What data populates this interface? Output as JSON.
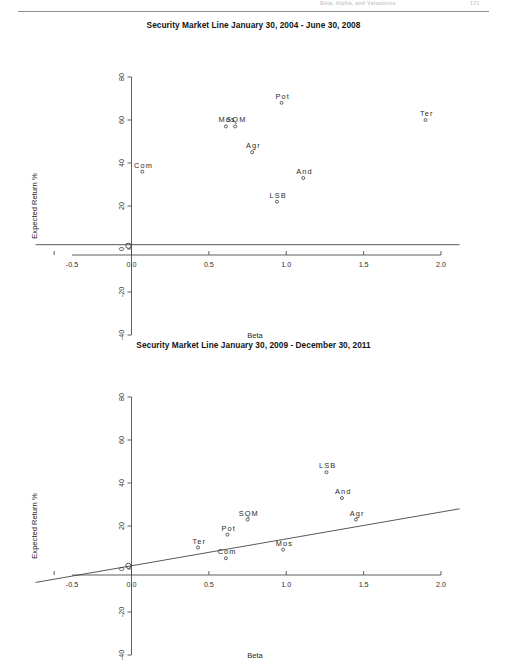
{
  "page": {
    "header_ghost_center": "Beta, Alpha, and Valuations",
    "header_ghost_right": "171"
  },
  "figures": [
    {
      "id": "figure-1",
      "title": "Security Market Line January 30, 2004 - June 30, 2008",
      "axis": {
        "xlabel": "Beta",
        "ylabel": "Expected Return %",
        "xticks": [
          "-0.5",
          "0.0",
          "0.5",
          "1.0",
          "1.5",
          "2.0"
        ],
        "xtick_values": [
          -0.5,
          0.0,
          0.5,
          1.0,
          1.5,
          2.0
        ],
        "yticks": [
          "80",
          "60",
          "40",
          "20",
          "0",
          "-20",
          "-40"
        ],
        "ytick_values": [
          80,
          60,
          40,
          20,
          0,
          -20,
          -40
        ]
      }
    },
    {
      "id": "figure-2",
      "title": "Security Market Line January 30, 2009 - December 30, 2011",
      "axis": {
        "xlabel": "Beta",
        "ylabel": "Expected Return %",
        "xticks": [
          "-0.5",
          "0.0",
          "0.5",
          "1.0",
          "1.5",
          "2.0"
        ],
        "xtick_values": [
          -0.5,
          0.0,
          0.5,
          1.0,
          1.5,
          2.0
        ],
        "yticks": [
          "80",
          "60",
          "40",
          "20",
          "0",
          "-20",
          "-40"
        ],
        "ytick_values": [
          80,
          60,
          40,
          20,
          0,
          -20,
          -40
        ]
      }
    }
  ],
  "chart_data": [
    {
      "type": "scatter",
      "title": "Security Market Line January 30, 2004 - June 30, 2008",
      "xlabel": "Beta",
      "ylabel": "Expected Return %",
      "xlim": [
        -0.62,
        2.12
      ],
      "ylim": [
        -44,
        84
      ],
      "grid": false,
      "legend": "none",
      "axis_style": "centered-cross",
      "points": [
        {
          "label": "Com",
          "x": 0.07,
          "y": 36
        },
        {
          "label": "Mos",
          "x": 0.61,
          "y": 57
        },
        {
          "label": "SQM",
          "x": 0.67,
          "y": 57
        },
        {
          "label": "Agr",
          "x": 0.78,
          "y": 45
        },
        {
          "label": "Pot",
          "x": 0.97,
          "y": 68
        },
        {
          "label": "And",
          "x": 1.11,
          "y": 33
        },
        {
          "label": "LSB",
          "x": 0.94,
          "y": 22
        },
        {
          "label": "Ter",
          "x": 1.9,
          "y": 60
        }
      ],
      "security_market_line": {
        "intercept": 2.0,
        "slope": 0.0,
        "x_from": -0.62,
        "x_to": 2.12,
        "description": "Flat security market line near zero slope"
      },
      "market_point": {
        "label": "",
        "x": -0.02,
        "y": 1.5
      }
    },
    {
      "type": "scatter",
      "title": "Security Market Line January 30, 2009 - December 30, 2011",
      "xlabel": "Beta",
      "ylabel": "Expected Return %",
      "xlim": [
        -0.62,
        2.12
      ],
      "ylim": [
        -44,
        84
      ],
      "grid": false,
      "legend": "none",
      "axis_style": "centered-cross",
      "points": [
        {
          "label": "Ter",
          "x": 0.43,
          "y": 10
        },
        {
          "label": "Pot",
          "x": 0.62,
          "y": 16
        },
        {
          "label": "Com",
          "x": 0.61,
          "y": 5
        },
        {
          "label": "SQM",
          "x": 0.75,
          "y": 23
        },
        {
          "label": "Mos",
          "x": 0.98,
          "y": 9
        },
        {
          "label": "LSB",
          "x": 1.26,
          "y": 45
        },
        {
          "label": "And",
          "x": 1.36,
          "y": 33
        },
        {
          "label": "Agr",
          "x": 1.45,
          "y": 23
        }
      ],
      "security_market_line": {
        "intercept": 1.5,
        "slope": 12.5,
        "x_from": -0.62,
        "x_to": 2.12,
        "description": "Upward sloping security market line through the origin"
      },
      "market_point": {
        "label": "",
        "x": -0.02,
        "y": 1.5
      }
    }
  ]
}
